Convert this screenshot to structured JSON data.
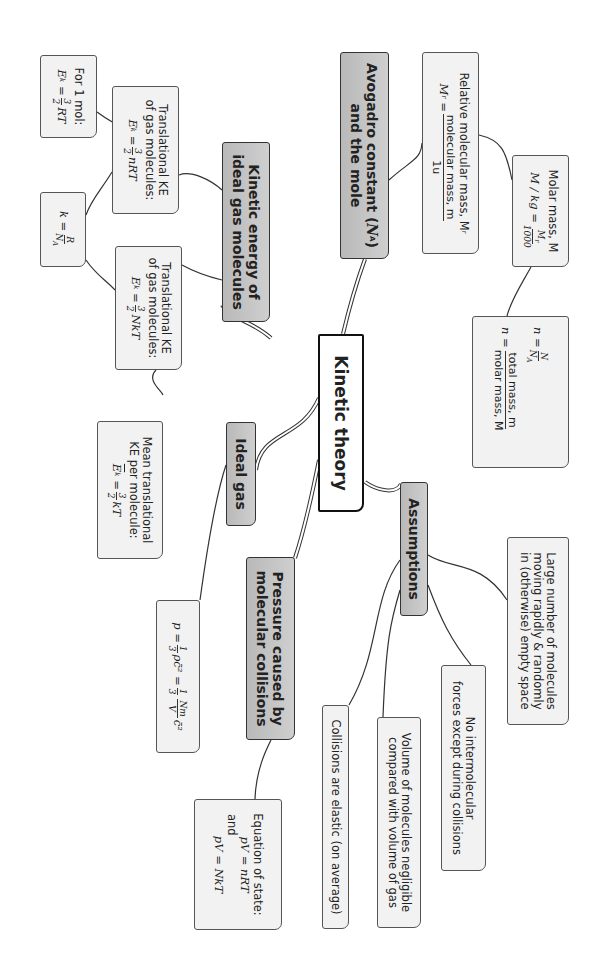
{
  "diagram": {
    "title": "Kinetic theory",
    "orientation": "rotated 90deg clockwise",
    "colors": {
      "branch_fill": "#c4c4c4",
      "leaf_fill": "#f2f2f2",
      "root_fill": "#ffffff",
      "line": "#333333"
    },
    "branches": {
      "kinetic_energy": {
        "label": "Kinetic energy of ideal gas molecules",
        "line1": "Kinetic energy of",
        "line2": "ideal gas molecules",
        "children": {
          "trans_nrt": {
            "line1": "Translational KE",
            "line2": "of gas molecules:",
            "lhs": "E",
            "lhs_sub": "k",
            "eq": "=",
            "num": "3",
            "den": "2",
            "rhs": "nRT"
          },
          "one_mol": {
            "line1": "For 1 mol:",
            "lhs": "E",
            "lhs_sub": "k",
            "eq": "=",
            "num": "3",
            "den": "2",
            "rhs": "RT"
          },
          "boltzmann": {
            "lhs": "k",
            "eq": "=",
            "num": "R",
            "den": "N",
            "den_sub": "A"
          },
          "trans_nkt": {
            "line1": "Translational KE",
            "line2": "of gas molecules:",
            "lhs": "E",
            "lhs_sub": "k",
            "eq": "=",
            "num": "3",
            "den": "2",
            "rhs": "NkT"
          },
          "mean_ke": {
            "line1": "Mean translational",
            "line2": "KE per molecule:",
            "lhs": "E",
            "lhs_sub": "k",
            "eq": "=",
            "num": "3",
            "den": "2",
            "rhs": "kT"
          }
        }
      },
      "avogadro": {
        "label": "Avogadro constant (NA) and the mole",
        "line1": "Avogadro constant (",
        "line1_sym": "N",
        "line1_sub": "A",
        "line1_end": ")",
        "line2": "and the mole",
        "children": {
          "relative_mass": {
            "line1": "Relative molecular mass, M",
            "line1_sub": "r",
            "lhs": "M",
            "lhs_sub": "r",
            "eq": "=",
            "num": "molecular mass, m",
            "den": "1u"
          },
          "molar_mass": {
            "line1": "Molar mass, M",
            "lhs": "M / kg",
            "eq": "=",
            "num": "M",
            "num_sub": "r",
            "den": "1000"
          },
          "moles": {
            "lhs1": "n",
            "eq": "=",
            "num1": "N",
            "den1": "N",
            "den1_sub": "A",
            "lhs2": "n",
            "num2": "total mass, m",
            "den2": "molar mass, M"
          }
        }
      },
      "assumptions": {
        "label": "Assumptions",
        "children": [
          {
            "line1": "Large number of molecules",
            "line2": "moving rapidly & randomly",
            "line3": "in (otherwise) empty space"
          },
          {
            "line1": "No intermolecular",
            "line2": "forces except during collisions"
          },
          {
            "line1": "Volume of molecules negligible",
            "line2": "compared with volume of gas"
          },
          {
            "line1": "Collisions are elastic (on average)"
          }
        ]
      },
      "ideal_gas": {
        "label": "Ideal gas",
        "children": {
          "pressure_formula": {
            "lhs": "p",
            "eq": "=",
            "num1": "1",
            "den1": "3",
            "mid": "ρc̄²",
            "eq2": "=",
            "num2": "1",
            "den2": "3",
            "num3": "Nm",
            "den3": "V",
            "rhs": "c̄²"
          }
        }
      },
      "pressure": {
        "label": "Pressure caused by molecular collisions",
        "line1": "Pressure caused by",
        "line2": "molecular collisions",
        "children": {
          "equation_of_state": {
            "line1": "Equation of state:",
            "eq1": "pV = nRT",
            "and": "and",
            "eq2": "pV = NkT"
          }
        }
      }
    }
  }
}
